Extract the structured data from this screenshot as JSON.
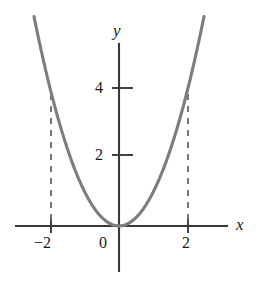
{
  "chart_data": {
    "type": "line",
    "title": "",
    "subtitle": "",
    "xlabel": "x",
    "ylabel": "y",
    "function": "y = x^2",
    "x": [
      -2.5,
      -2.4,
      -2.3,
      -2.2,
      -2.1,
      -2.0,
      -1.9,
      -1.8,
      -1.7,
      -1.6,
      -1.5,
      -1.4,
      -1.3,
      -1.2,
      -1.1,
      -1.0,
      -0.9,
      -0.8,
      -0.7,
      -0.6,
      -0.5,
      -0.4,
      -0.3,
      -0.2,
      -0.1,
      0.0,
      0.1,
      0.2,
      0.3,
      0.4,
      0.5,
      0.6,
      0.7,
      0.8,
      0.9,
      1.0,
      1.1,
      1.2,
      1.3,
      1.4,
      1.5,
      1.6,
      1.7,
      1.8,
      1.9,
      2.0,
      2.1,
      2.2,
      2.3,
      2.4,
      2.5
    ],
    "y": [
      6.25,
      5.76,
      5.29,
      4.84,
      4.41,
      4.0,
      3.61,
      3.24,
      2.89,
      2.56,
      2.25,
      1.96,
      1.69,
      1.44,
      1.21,
      1.0,
      0.81,
      0.64,
      0.49,
      0.36,
      0.25,
      0.16,
      0.09,
      0.04,
      0.01,
      0.0,
      0.01,
      0.04,
      0.09,
      0.16,
      0.25,
      0.36,
      0.49,
      0.64,
      0.81,
      1.0,
      1.21,
      1.44,
      1.69,
      1.96,
      2.25,
      2.56,
      2.89,
      3.24,
      3.61,
      4.0,
      4.41,
      4.84,
      5.29,
      5.76,
      6.25
    ],
    "xlim": [
      -3.1,
      3.25
    ],
    "ylim": [
      -1.4,
      5.5
    ],
    "xticks": [
      -2,
      2
    ],
    "xtick_labels": [
      "−2",
      "2"
    ],
    "yticks": [
      2,
      4
    ],
    "ytick_labels": [
      "2",
      "4"
    ],
    "origin_label": "0",
    "grid": false,
    "legend": null,
    "annotations": [
      {
        "name": "dashed-drop-line-left",
        "type": "dashed-vertical",
        "x": -2,
        "y_from": 0,
        "y_to": 4
      },
      {
        "name": "dashed-drop-line-right",
        "type": "dashed-vertical",
        "x": 2,
        "y_from": 0,
        "y_to": 4
      }
    ],
    "colors": {
      "curve": "#7d7d7d",
      "axis": "#3a3a3a",
      "dashed": "#6a6a6a",
      "text": "#1a1a1a",
      "background": "#ffffff"
    }
  },
  "labels": {
    "x_axis_name": "x",
    "y_axis_name": "y",
    "y_tick_4": "4",
    "y_tick_2": "2",
    "x_tick_neg2": "−2",
    "x_tick_2": "2",
    "origin": "0"
  }
}
